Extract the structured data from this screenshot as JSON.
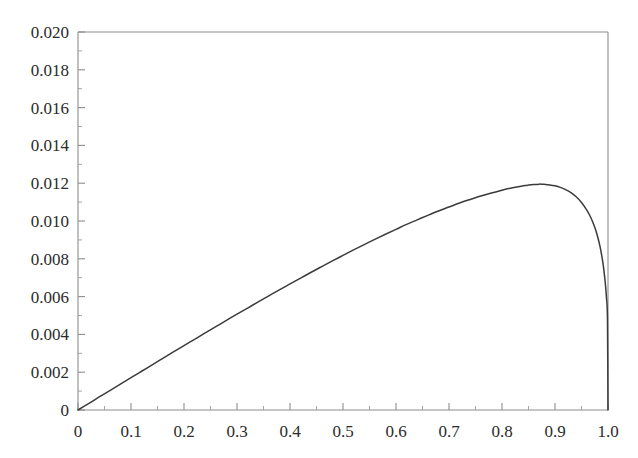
{
  "chart_data": {
    "type": "line",
    "title": "",
    "subtitle": "",
    "xlabel": "",
    "ylabel": "",
    "xlim": [
      0,
      1.0
    ],
    "ylim": [
      0,
      0.02
    ],
    "grid": false,
    "legend": null,
    "x_ticks": [
      "0",
      "0.1",
      "0.2",
      "0.3",
      "0.4",
      "0.5",
      "0.6",
      "0.7",
      "0.8",
      "0.9",
      "1.0"
    ],
    "x_tick_values": [
      0,
      0.1,
      0.2,
      0.3,
      0.4,
      0.5,
      0.6,
      0.7,
      0.8,
      0.9,
      1.0
    ],
    "x_minor_step": 0.05,
    "y_ticks": [
      "0",
      "0.002",
      "0.004",
      "0.006",
      "0.008",
      "0.010",
      "0.012",
      "0.014",
      "0.016",
      "0.018",
      "0.020"
    ],
    "y_tick_values": [
      0,
      0.002,
      0.004,
      0.006,
      0.008,
      0.01,
      0.012,
      0.014,
      0.016,
      0.018,
      0.02
    ],
    "y_minor_step": 0.001,
    "axis_color": "#8d8d8d",
    "curve_color": "#3b3b3b",
    "background_color": "#ffffff",
    "peak": {
      "x": 0.875,
      "y": 0.0155
    },
    "series": [
      {
        "name": "curve",
        "x": [
          0.0,
          0.02,
          0.04,
          0.06,
          0.08,
          0.1,
          0.12,
          0.14,
          0.16,
          0.18,
          0.2,
          0.22,
          0.24,
          0.26,
          0.28,
          0.3,
          0.32,
          0.34,
          0.36,
          0.38,
          0.4,
          0.42,
          0.44,
          0.46,
          0.48,
          0.5,
          0.52,
          0.54,
          0.56,
          0.58,
          0.6,
          0.62,
          0.64,
          0.66,
          0.68,
          0.7,
          0.72,
          0.74,
          0.76,
          0.78,
          0.8,
          0.82,
          0.84,
          0.85,
          0.86,
          0.87,
          0.875,
          0.88,
          0.89,
          0.9,
          0.91,
          0.92,
          0.93,
          0.94,
          0.95,
          0.96,
          0.965,
          0.97,
          0.975,
          0.98,
          0.985,
          0.99,
          0.993,
          0.995,
          0.997,
          0.999,
          1.0
        ],
        "y": [
          0.0,
          0.00034,
          0.00069,
          0.00103,
          0.00137,
          0.00171,
          0.00205,
          0.00239,
          0.00273,
          0.00307,
          0.00341,
          0.00374,
          0.00408,
          0.00441,
          0.00474,
          0.00507,
          0.00539,
          0.00572,
          0.00604,
          0.00636,
          0.00667,
          0.00698,
          0.00729,
          0.00759,
          0.00789,
          0.00818,
          0.00847,
          0.00875,
          0.00903,
          0.0093,
          0.00956,
          0.00982,
          0.01006,
          0.0103,
          0.01053,
          0.01074,
          0.01095,
          0.01114,
          0.01132,
          0.01148,
          0.01163,
          0.01176,
          0.01186,
          0.0119,
          0.01193,
          0.01195,
          0.01195,
          0.01194,
          0.01191,
          0.01186,
          0.01178,
          0.01166,
          0.0115,
          0.01128,
          0.01098,
          0.01058,
          0.01033,
          0.01003,
          0.00967,
          0.00922,
          0.00864,
          0.00786,
          0.00722,
          0.00668,
          0.00598,
          0.0048,
          0.0
        ]
      }
    ]
  },
  "axes": {
    "left_px": 78,
    "right_px": 608,
    "top_px": 32,
    "bottom_px": 410
  }
}
